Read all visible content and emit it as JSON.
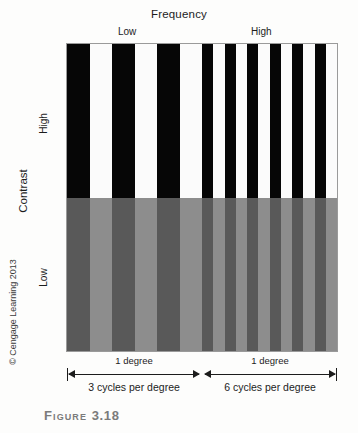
{
  "figure": {
    "caption_label": "Figure",
    "caption_number": "3.18",
    "copyright": "© Cengage Learning 2013"
  },
  "axes": {
    "x_title": "Frequency",
    "x_low_label": "Low",
    "x_high_label": "High",
    "y_title": "Contrast",
    "y_high_label": "High",
    "y_low_label": "Low"
  },
  "markers": {
    "left_degree_label": "1 degree",
    "right_degree_label": "1 degree",
    "left_cycles_caption": "3 cycles per degree",
    "right_cycles_caption": "6 cycles per degree"
  },
  "chart_data": {
    "type": "heatmap",
    "title": "Frequency",
    "xlabel": "Frequency",
    "ylabel": "Contrast",
    "grid": false,
    "legend": "none",
    "columns": [
      {
        "name": "low-frequency",
        "cycles_per_degree": 3,
        "span_degrees": 1,
        "bars_per_row": 6
      },
      {
        "name": "high-frequency",
        "cycles_per_degree": 6,
        "span_degrees": 1,
        "bars_per_row": 12
      }
    ],
    "rows": [
      {
        "name": "high-contrast",
        "contrast": "High",
        "dark_color": "#060606",
        "light_color": "#fbfbfb"
      },
      {
        "name": "low-contrast",
        "contrast": "Low",
        "dark_color": "#595959",
        "light_color": "#8d8d8d"
      }
    ],
    "series": [
      {
        "name": "High contrast, 3 cpd",
        "contrast_level": 1.0,
        "cycles_per_degree": 3
      },
      {
        "name": "High contrast, 6 cpd",
        "contrast_level": 1.0,
        "cycles_per_degree": 6
      },
      {
        "name": "Low contrast, 3 cpd",
        "contrast_level": 0.25,
        "cycles_per_degree": 3
      },
      {
        "name": "Low contrast, 6 cpd",
        "contrast_level": 0.25,
        "cycles_per_degree": 6
      }
    ]
  },
  "colors": {
    "panel_border": "#9a9a9a",
    "text": "#1c1c1c",
    "caption_gray": "#7b7b7b",
    "background": "#fdfdfc"
  }
}
